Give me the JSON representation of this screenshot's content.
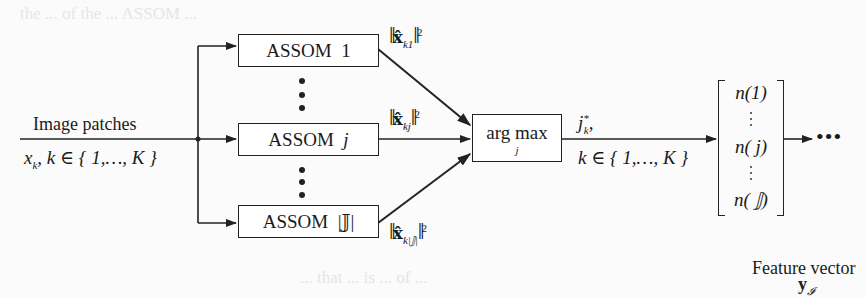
{
  "diagram": {
    "input": {
      "label": "Image patches",
      "subscript_expr_var": "x",
      "subscript_expr_sub": "k",
      "subscript_expr_rest": ", k ∈ { 1,…, K }"
    },
    "assom_blocks": [
      {
        "name": "ASSOM",
        "index": "1",
        "norm_sub": "k1"
      },
      {
        "name": "ASSOM",
        "index": "j",
        "norm_sub": "kj"
      },
      {
        "name": "ASSOM",
        "index": "|𝕁|",
        "norm_sub": "k|𝕁|"
      }
    ],
    "norm": {
      "symbol": "x̂",
      "power": "2"
    },
    "selector": {
      "label": "arg max",
      "sub": "j"
    },
    "selector_output": {
      "top_var": "j",
      "top_sup": "*",
      "top_sub": "k",
      "top_tail": ",",
      "bottom": "k ∈ { 1,…, K }"
    },
    "feature_vector": {
      "entries": [
        "n(1)",
        "n( j)",
        "n( 𝕁)"
      ],
      "label": "Feature vector",
      "symbol": "y",
      "symbol_sub": "𝓘"
    },
    "continuation": "•••",
    "colors": {
      "line": "#222222",
      "background": "#fbfbfb"
    }
  },
  "background_bleed": [
    "the ... of the ... ASSOM ...",
    "... that ... is ... of ..."
  ]
}
